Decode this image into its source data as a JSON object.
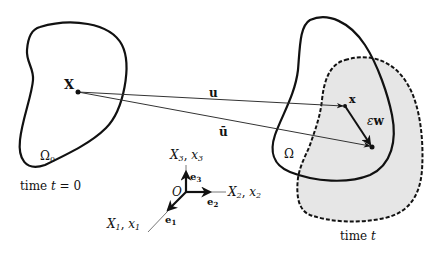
{
  "diagram": {
    "type": "continuum-deformation",
    "colors": {
      "stroke": "#111111",
      "thin_stroke": "#333333",
      "shaded_region": "#e6e6e6",
      "background": "#ffffff"
    },
    "reference_config": {
      "region_label": "Ω",
      "region_subscript": "0",
      "caption_prefix": "time ",
      "caption_var": "t",
      "caption_suffix": " = 0",
      "point_label": "X"
    },
    "current_config": {
      "region_label": "Ω",
      "caption_prefix": "time ",
      "caption_var": "t",
      "point_label": "x"
    },
    "vectors": {
      "displacement": "u",
      "perturbed_displacement": "ū",
      "variation_prefix": "ε",
      "variation_vector": "w"
    },
    "axes": {
      "origin_label": "O",
      "axis3": {
        "upper": "X",
        "upper_sub": "3",
        "lower": "x",
        "lower_sub": "3",
        "basis": "e",
        "basis_sub": "3"
      },
      "axis2": {
        "upper": "X",
        "upper_sub": "2",
        "lower": "x",
        "lower_sub": "2",
        "basis": "e",
        "basis_sub": "2"
      },
      "axis1": {
        "upper": "X",
        "upper_sub": "1",
        "lower": "x",
        "lower_sub": "1",
        "basis": "e",
        "basis_sub": "1"
      },
      "separator": ", "
    }
  }
}
